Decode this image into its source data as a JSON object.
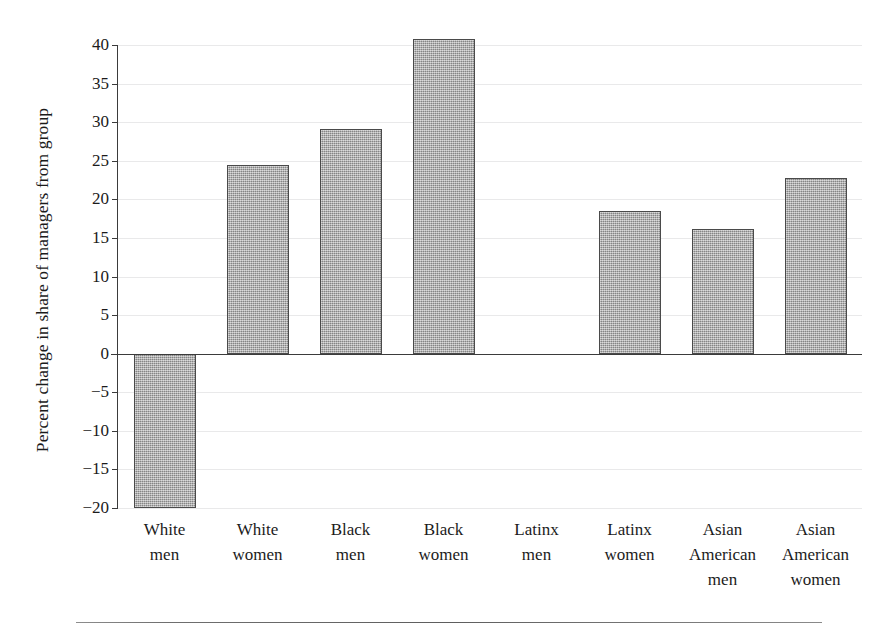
{
  "chart_data": {
    "type": "bar",
    "title": "",
    "xlabel": "",
    "ylabel": "Percent change in share of managers from group",
    "categories": [
      "White men",
      "White women",
      "Black men",
      "Black women",
      "Latinx men",
      "Latinx women",
      "Asian American men",
      "Asian American women"
    ],
    "category_lines": [
      [
        "White",
        "men"
      ],
      [
        "White",
        "women"
      ],
      [
        "Black",
        "men"
      ],
      [
        "Black",
        "women"
      ],
      [
        "Latinx",
        "men"
      ],
      [
        "Latinx",
        "women"
      ],
      [
        "Asian",
        "American",
        "men"
      ],
      [
        "Asian",
        "American",
        "women"
      ]
    ],
    "values": [
      -20.0,
      24.4,
      29.1,
      40.8,
      0.0,
      18.5,
      16.2,
      22.8
    ],
    "ylim": [
      -20,
      40
    ],
    "yticks": [
      40,
      35,
      30,
      25,
      20,
      15,
      10,
      5,
      0,
      -5,
      -10,
      -15,
      -20
    ],
    "ytick_labels": [
      "40",
      "35",
      "30",
      "25",
      "20",
      "15",
      "10",
      "5",
      "0",
      "−5",
      "−10",
      "−15",
      "−20"
    ],
    "grid": true,
    "grid_axis": "y",
    "legend": null,
    "bar_color": "#a9a9a9",
    "bar_edge_color": "#4a4a4a",
    "axis_color": "#3b3b3b",
    "grid_color": "#e9e9ea",
    "background_color": "#ffffff"
  }
}
